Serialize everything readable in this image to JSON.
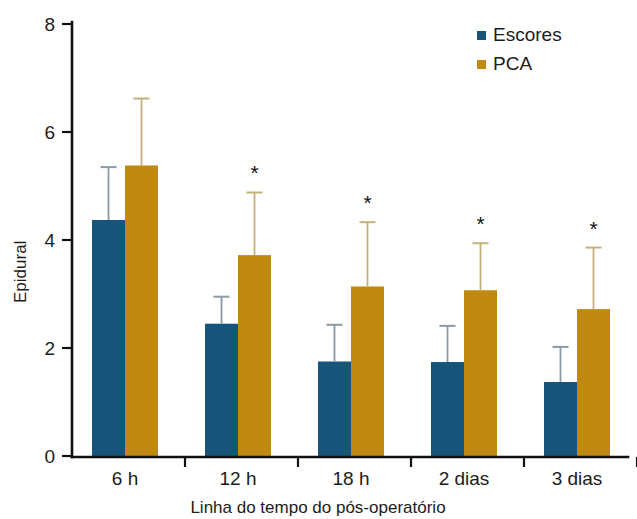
{
  "chart_data": {
    "type": "bar",
    "title": "",
    "subtitle": "",
    "xlabel": "Linha do tempo do pós-operatório",
    "ylabel": "Epidural",
    "categories": [
      "6 h",
      "12 h",
      "18 h",
      "2 dias",
      "3 dias"
    ],
    "ylim": [
      0,
      8
    ],
    "yticks": [
      0,
      2,
      4,
      6,
      8
    ],
    "ytick_labels": [
      "0",
      "2",
      "4",
      "6",
      "8"
    ],
    "grid": false,
    "legend_position": "top-right",
    "orientation": "vertical",
    "series": [
      {
        "name": "Escores",
        "color": "#17547a",
        "values": [
          4.37,
          2.45,
          1.75,
          1.74,
          1.37
        ],
        "errors_upper": [
          5.35,
          2.95,
          2.43,
          2.41,
          2.02
        ],
        "error_color": "#8a9aa6",
        "significance": [
          "",
          "",
          "",
          "",
          ""
        ]
      },
      {
        "name": "PCA",
        "color": "#c08a12",
        "values": [
          5.38,
          3.72,
          3.14,
          3.07,
          2.72
        ],
        "errors_upper": [
          6.62,
          4.88,
          4.33,
          3.94,
          3.86
        ],
        "error_color": "#c4b07a",
        "significance": [
          "",
          "*",
          "*",
          "*",
          "*"
        ]
      }
    ]
  },
  "legend": {
    "items": [
      {
        "label": "Escores",
        "color": "#17547a"
      },
      {
        "label": "PCA",
        "color": "#c08a12"
      }
    ]
  },
  "axes": {
    "y_axis_title": "Epidural",
    "x_axis_title": "Linha do tempo do pós-operatório"
  },
  "annotations": {
    "significance_marker": "*"
  }
}
